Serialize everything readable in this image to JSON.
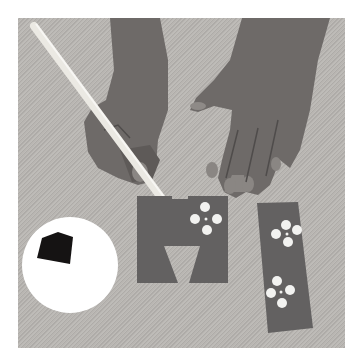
{
  "image": {
    "description": "Two hands painting white flower dots through cut-out paper stencils on a textured grey fabric surface, with a white paint palette containing dark paint",
    "colors": {
      "background_fabric": "#b9b6b2",
      "skin": "#6e6a68",
      "skin_shadow": "#4f4c4b",
      "stencil_paper": "#636161",
      "palette": "#ffffff",
      "paint_dark": "#151313",
      "flower_dots": "#f2f2f0",
      "brush": "#ebe9e3"
    },
    "objects": [
      {
        "name": "paintbrush",
        "label": "paintbrush"
      },
      {
        "name": "left-hand",
        "label": "hand holding brush"
      },
      {
        "name": "right-hand",
        "label": "flat open hand"
      },
      {
        "name": "square-stencil",
        "label": "stencil with trapezoid cutout and flower"
      },
      {
        "name": "strip-stencil",
        "label": "strip stencil with two flowers"
      },
      {
        "name": "paint-palette",
        "label": "round white palette with dark paint"
      }
    ]
  }
}
